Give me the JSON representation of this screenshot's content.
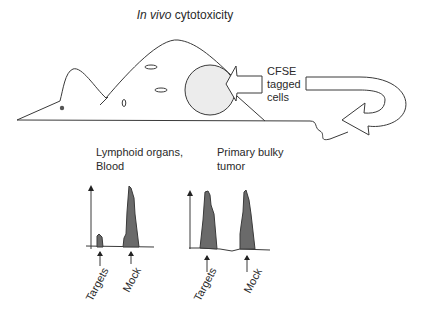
{
  "title": {
    "italic": "In vivo",
    "rest": " cytotoxicity"
  },
  "injection_label": [
    "CFSE",
    "tagged",
    "cells"
  ],
  "panels": [
    {
      "label_lines": [
        "Lymphoid organs,",
        "Blood"
      ],
      "peaks": [
        {
          "name": "Targets",
          "relative_height": 0.27
        },
        {
          "name": "Mock",
          "relative_height": 1.0
        }
      ]
    },
    {
      "label_lines": [
        "Primary bulky",
        "tumor"
      ],
      "peaks": [
        {
          "name": "Targets",
          "relative_height": 1.0
        },
        {
          "name": "Mock",
          "relative_height": 1.0
        }
      ]
    }
  ],
  "colors": {
    "line": "#3a3a3a",
    "peak_fill": "#6a6a6a",
    "tumor_fill": "#ececec",
    "text": "#2a2a2a"
  }
}
